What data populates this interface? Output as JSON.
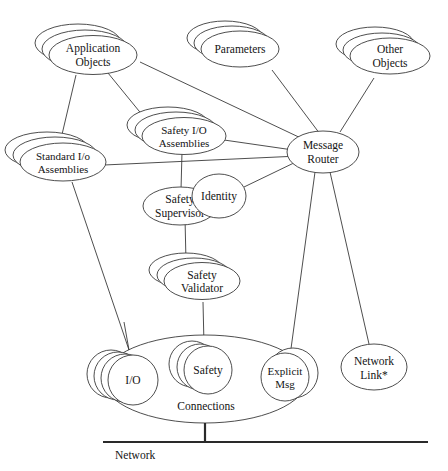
{
  "diagram": {
    "title_visible": false,
    "type": "object-model-network-diagram",
    "stroke_color": "#3a3a3a",
    "text_color": "#141414",
    "background": "#ffffff",
    "bus": {
      "label": "Network"
    },
    "nodes": [
      {
        "id": "application_objects",
        "label_line1": "Application",
        "label_line2": "Objects",
        "shape": "ellipse",
        "stack": 3
      },
      {
        "id": "parameters",
        "label_line1": "Parameters",
        "label_line2": "",
        "shape": "ellipse",
        "stack": 3
      },
      {
        "id": "other_objects",
        "label_line1": "Other",
        "label_line2": "Objects",
        "shape": "ellipse",
        "stack": 3
      },
      {
        "id": "safety_io_assemblies",
        "label_line1": "Safety I/O",
        "label_line2": "Assemblies",
        "shape": "ellipse",
        "stack": 3
      },
      {
        "id": "standard_io_assemblies",
        "label_line1": "Standard I/o",
        "label_line2": "Assemblies",
        "shape": "ellipse",
        "stack": 3
      },
      {
        "id": "message_router",
        "label_line1": "Message",
        "label_line2": "Router",
        "shape": "ellipse",
        "stack": 1
      },
      {
        "id": "safety_supervisor",
        "label_line1": "Safety",
        "label_line2": "Supervisor",
        "shape": "ellipse",
        "stack": 1
      },
      {
        "id": "identity",
        "label_line1": "Identity",
        "label_line2": "",
        "shape": "ellipse",
        "stack": 1
      },
      {
        "id": "safety_validator",
        "label_line1": "Safety",
        "label_line2": "Validator",
        "shape": "ellipse",
        "stack": 3
      },
      {
        "id": "connections",
        "label_line1": "Connections",
        "label_line2": "",
        "shape": "ellipse",
        "stack": 1
      },
      {
        "id": "io",
        "label_line1": "I/O",
        "label_line2": "",
        "shape": "circle",
        "stack": 4
      },
      {
        "id": "safety",
        "label_line1": "Safety",
        "label_line2": "",
        "shape": "circle",
        "stack": 3
      },
      {
        "id": "explicit_msg",
        "label_line1": "Explicit",
        "label_line2": "Msg",
        "shape": "circle",
        "stack": 2
      },
      {
        "id": "network_link",
        "label_line1": "Network",
        "label_line2": "Link*",
        "shape": "ellipse",
        "stack": 1
      }
    ],
    "edges": [
      {
        "from": "application_objects",
        "to": "standard_io_assemblies"
      },
      {
        "from": "application_objects",
        "to": "safety_io_assemblies"
      },
      {
        "from": "application_objects",
        "to": "message_router"
      },
      {
        "from": "parameters",
        "to": "message_router"
      },
      {
        "from": "other_objects",
        "to": "message_router"
      },
      {
        "from": "safety_io_assemblies",
        "to": "message_router"
      },
      {
        "from": "safety_io_assemblies",
        "to": "safety_supervisor"
      },
      {
        "from": "standard_io_assemblies",
        "to": "message_router"
      },
      {
        "from": "standard_io_assemblies",
        "to": "connections"
      },
      {
        "from": "identity",
        "to": "message_router"
      },
      {
        "from": "safety_supervisor",
        "to": "safety_validator"
      },
      {
        "from": "safety_validator",
        "to": "safety"
      },
      {
        "from": "message_router",
        "to": "explicit_msg"
      },
      {
        "from": "message_router",
        "to": "network_link"
      },
      {
        "from": "connections",
        "to": "bus"
      },
      {
        "from": "io",
        "to": "connections_top"
      }
    ]
  }
}
